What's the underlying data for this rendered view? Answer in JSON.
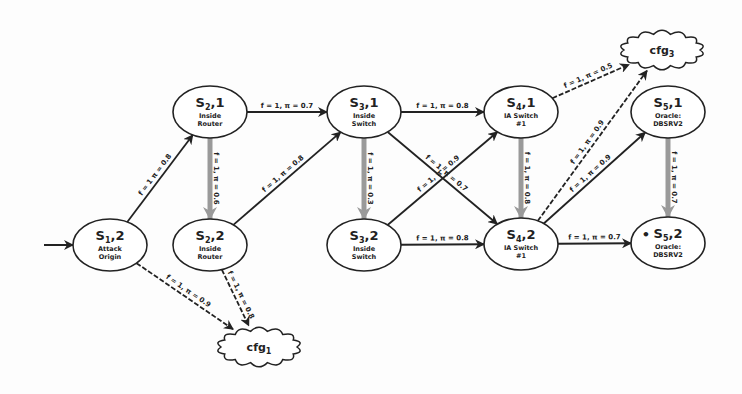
{
  "diagram": {
    "type": "attack-state-graph",
    "entry_arrow": true,
    "nodes": [
      {
        "id": "S1_2",
        "title": "S",
        "sub_index": "1",
        "state": ",2",
        "line1": "Attack",
        "line2": "Origin",
        "x": 110,
        "y": 245
      },
      {
        "id": "S2_1",
        "title": "S",
        "sub_index": "2",
        "state": ",1",
        "line1": "Inside",
        "line2": "Router",
        "x": 210,
        "y": 112
      },
      {
        "id": "S2_2",
        "title": "S",
        "sub_index": "2",
        "state": ",2",
        "line1": "Inside",
        "line2": "Router",
        "x": 210,
        "y": 245
      },
      {
        "id": "S3_1",
        "title": "S",
        "sub_index": "3",
        "state": ",1",
        "line1": "Inside",
        "line2": "Switch",
        "x": 364,
        "y": 112
      },
      {
        "id": "S3_2",
        "title": "S",
        "sub_index": "3",
        "state": ",2",
        "line1": "Inside",
        "line2": "Switch",
        "x": 364,
        "y": 245
      },
      {
        "id": "S4_1",
        "title": "S",
        "sub_index": "4",
        "state": ",1",
        "line1": "IA Switch",
        "line2": "#1",
        "x": 521,
        "y": 112
      },
      {
        "id": "S4_2",
        "title": "S",
        "sub_index": "4",
        "state": ",2",
        "line1": "IA Switch",
        "line2": "#1",
        "x": 521,
        "y": 244
      },
      {
        "id": "S5_1",
        "title": "S",
        "sub_index": "5",
        "state": ",1",
        "line1": "Oracle:",
        "line2": "DBSRV2",
        "x": 668,
        "y": 112
      },
      {
        "id": "S5_2",
        "title": "S",
        "sub_index": "5",
        "state": ",2",
        "line1": "Oracle:",
        "line2": "DBSRV2",
        "x": 668,
        "y": 243,
        "marker": "•"
      }
    ],
    "clouds": [
      {
        "id": "cfg3",
        "label": "cfg",
        "sub_index": "3",
        "x": 662,
        "y": 50
      },
      {
        "id": "cfg1",
        "label": "cfg",
        "sub_index": "1",
        "x": 259,
        "y": 347
      }
    ],
    "edges": [
      {
        "from": "S1_2",
        "to": "S2_1",
        "label": "f = 1  π = 0.8",
        "style": "solid"
      },
      {
        "from": "S2_1",
        "to": "S3_1",
        "label": "f = 1,  π = 0.7",
        "style": "solid"
      },
      {
        "from": "S2_1",
        "to": "S2_2",
        "label": "f = 1,  π = 0.6",
        "style": "gray"
      },
      {
        "from": "S2_2",
        "to": "S3_1",
        "label": "f = 1,  π = 0.8",
        "style": "solid"
      },
      {
        "from": "S3_1",
        "to": "S4_1",
        "label": "f = 1,  π = 0.8",
        "style": "solid"
      },
      {
        "from": "S3_1",
        "to": "S4_2",
        "label": "f = 1,  π = 0.7",
        "style": "solid"
      },
      {
        "from": "S3_1",
        "to": "S3_2",
        "label": "f = 1,  π = 0.3",
        "style": "gray"
      },
      {
        "from": "S3_2",
        "to": "S4_1",
        "label": "f = 1,  π = 0.9",
        "style": "solid"
      },
      {
        "from": "S3_2",
        "to": "S4_2",
        "label": "f = 1,  π = 0.8",
        "style": "solid"
      },
      {
        "from": "S4_1",
        "to": "cfg3",
        "label": "f = 1,  π = 0.5",
        "style": "dashed"
      },
      {
        "from": "S4_1",
        "to": "S4_2",
        "label": "f = 1,  π = 0.8",
        "style": "gray"
      },
      {
        "from": "S4_2",
        "to": "cfg3",
        "label": "f = 1,  π = 0.9",
        "style": "dashed"
      },
      {
        "from": "S4_2",
        "to": "S5_1",
        "label": "f = 1,  π = 0.9",
        "style": "solid"
      },
      {
        "from": "S4_2",
        "to": "S5_2",
        "label": "f = 1,  π = 0.7",
        "style": "solid"
      },
      {
        "from": "S5_1",
        "to": "S5_2",
        "label": "f = 1,  π = 0.7",
        "style": "gray"
      },
      {
        "from": "S1_2",
        "to": "cfg1",
        "label": "f = 1,  π = 0.9",
        "style": "dashed"
      },
      {
        "from": "S2_2",
        "to": "cfg1",
        "label": "f = 1,  π = 0.8",
        "style": "dashed"
      }
    ]
  },
  "colors": {
    "stroke": "#222222",
    "gray_arrow": "#9a9a9a",
    "background": "#fdfdfd"
  }
}
